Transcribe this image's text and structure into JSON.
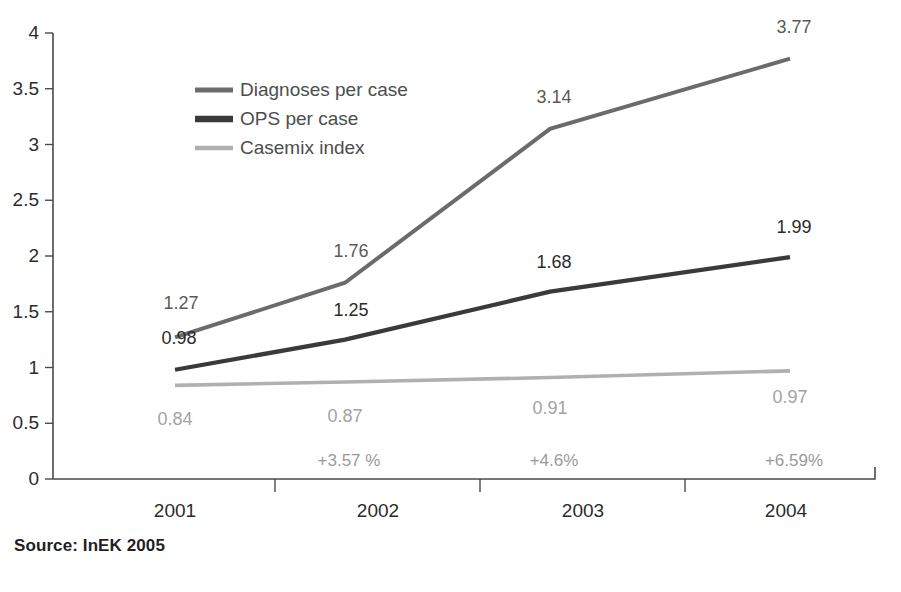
{
  "source_note": "Source: InEK 2005",
  "chart_data": {
    "type": "line",
    "title": "",
    "subtitle": "",
    "xlabel": "",
    "ylabel": "",
    "ylim": [
      0,
      4
    ],
    "ytick_step": 0.5,
    "grid": false,
    "legend_position": "inside-top-left",
    "categories": [
      "2001",
      "2002",
      "2003",
      "2004"
    ],
    "ytick_labels": [
      "0",
      "0.5",
      "1",
      "1.5",
      "2",
      "2.5",
      "3",
      "3.5",
      "4"
    ],
    "series": [
      {
        "name": "Diagnoses per case",
        "color": "#6b6b6b",
        "values": [
          1.27,
          1.76,
          3.14,
          3.77
        ],
        "labels": [
          "1.27",
          "1.76",
          "3.14",
          "3.77"
        ],
        "label_color": "#5a5a5a"
      },
      {
        "name": "OPS per case",
        "color": "#3a3a3a",
        "values": [
          0.98,
          1.25,
          1.68,
          1.99
        ],
        "labels": [
          "0.98",
          "1.25",
          "1.68",
          "1.99"
        ],
        "label_color": "#2b2b2b"
      },
      {
        "name": "Casemix index",
        "color": "#b0b0b0",
        "values": [
          0.84,
          0.87,
          0.91,
          0.97
        ],
        "labels": [
          "0.84",
          "0.87",
          "0.91",
          "0.97"
        ],
        "label_color": "#a3a3a3"
      }
    ],
    "annotations": {
      "growth_labels": [
        "",
        "+3.57 %",
        "+4.6%",
        "+6.59%"
      ],
      "growth_series": "Casemix index"
    }
  }
}
